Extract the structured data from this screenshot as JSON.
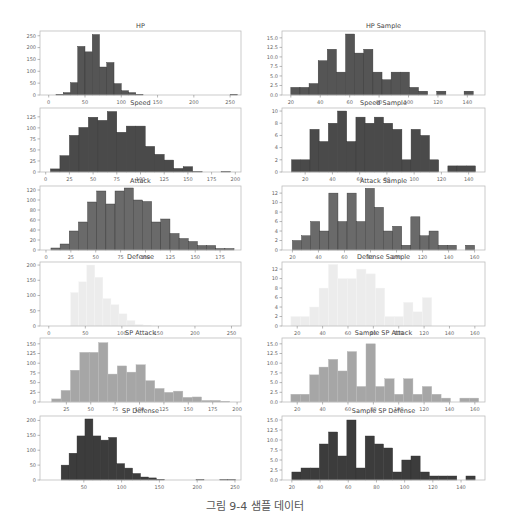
{
  "caption": "그림 9-4 샘플 데이터",
  "colors": {
    "HP": "#555555",
    "Speed": "#4a4a4a",
    "Attack": "#6a6a6a",
    "Defense": "#ececec",
    "SP Attack": "#a6a6a6",
    "SP Defense": "#3c3c3c"
  },
  "chart_data": [
    {
      "type": "bar",
      "title": "HP",
      "col": 0,
      "row": 0,
      "color_key": "HP",
      "bins_start": 0,
      "bin_width": 10,
      "xlim": [
        -12,
        265
      ],
      "ylim": [
        0,
        270
      ],
      "xticks": [
        0,
        50,
        100,
        150,
        200,
        250
      ],
      "yticks": [
        0,
        50,
        100,
        150,
        200,
        250
      ],
      "values": [
        0,
        3,
        10,
        52,
        205,
        182,
        255,
        118,
        137,
        48,
        18,
        10,
        3,
        0,
        0,
        0,
        0,
        0,
        0,
        0,
        0,
        0,
        0,
        0,
        0,
        3
      ]
    },
    {
      "type": "bar",
      "title": "HP Sample",
      "col": 1,
      "row": 0,
      "color_key": "HP",
      "bins_start": 20,
      "bin_width": 6.2,
      "xlim": [
        14,
        152
      ],
      "ylim": [
        0,
        16.8
      ],
      "xticks": [
        20,
        40,
        60,
        80,
        100,
        120,
        140
      ],
      "yticks": [
        0,
        2.5,
        5,
        7.5,
        10,
        12.5,
        15
      ],
      "ytick_labels": [
        "0.0",
        "2.5",
        "5.0",
        "7.5",
        "10.0",
        "12.5",
        "15.0"
      ],
      "values": [
        2,
        2,
        3,
        9,
        12,
        6,
        16,
        11,
        12,
        6,
        4,
        6,
        6,
        2,
        1,
        0,
        1,
        0,
        0,
        1
      ]
    },
    {
      "type": "bar",
      "title": "Speed",
      "col": 0,
      "row": 1,
      "color_key": "Speed",
      "bins_start": 5,
      "bin_width": 10,
      "xlim": [
        -6,
        206
      ],
      "ylim": [
        0,
        145
      ],
      "xticks": [
        0,
        25,
        50,
        75,
        100,
        125,
        150,
        175,
        200
      ],
      "yticks": [
        0,
        25,
        50,
        75,
        100,
        125
      ],
      "values": [
        7,
        37,
        83,
        101,
        124,
        117,
        137,
        90,
        104,
        104,
        58,
        40,
        27,
        8,
        12,
        1,
        0,
        0,
        1,
        0
      ]
    },
    {
      "type": "bar",
      "title": "Speed Sample",
      "col": 1,
      "row": 1,
      "color_key": "Speed",
      "bins_start": 10,
      "bin_width": 6.75,
      "xlim": [
        3,
        152
      ],
      "ylim": [
        0,
        10.5
      ],
      "xticks": [
        20,
        40,
        60,
        80,
        100,
        120,
        140
      ],
      "yticks": [
        0,
        2,
        4,
        6,
        8,
        10
      ],
      "values": [
        2,
        2,
        7,
        5,
        8,
        10,
        5,
        9,
        8,
        9,
        8,
        7,
        2,
        7,
        6,
        2,
        0,
        1,
        1,
        1
      ]
    },
    {
      "type": "bar",
      "title": "Attack",
      "col": 0,
      "row": 2,
      "color_key": "Attack",
      "bins_start": 5,
      "bin_width": 9.2,
      "xlim": [
        -6,
        196
      ],
      "ylim": [
        0,
        128
      ],
      "xticks": [
        0,
        25,
        50,
        75,
        100,
        125,
        150,
        175
      ],
      "yticks": [
        0,
        20,
        40,
        60,
        80,
        100,
        120
      ],
      "values": [
        4,
        12,
        38,
        56,
        96,
        118,
        92,
        118,
        124,
        100,
        97,
        56,
        62,
        33,
        23,
        17,
        9,
        9,
        3,
        3
      ]
    },
    {
      "type": "bar",
      "title": "Attack Sample",
      "col": 1,
      "row": 2,
      "color_key": "Attack",
      "bins_start": 20,
      "bin_width": 7,
      "xlim": [
        12,
        168
      ],
      "ylim": [
        0,
        13.5
      ],
      "xticks": [
        20,
        40,
        60,
        80,
        100,
        120,
        140,
        160
      ],
      "yticks": [
        0,
        2,
        4,
        6,
        8,
        10,
        12
      ],
      "values": [
        2,
        3,
        6,
        4,
        12,
        6,
        12,
        6,
        13,
        9,
        4,
        5,
        1,
        7,
        3,
        4,
        1,
        1,
        0,
        1
      ]
    },
    {
      "type": "bar",
      "title": "Defense",
      "col": 0,
      "row": 3,
      "color_key": "Defense",
      "bins_start": 30,
      "bin_width": 11,
      "xlim": [
        -12,
        263
      ],
      "ylim": [
        0,
        210
      ],
      "xticks": [
        0,
        50,
        100,
        150,
        200,
        250
      ],
      "yticks": [
        0,
        50,
        100,
        150,
        200
      ],
      "values": [
        110,
        145,
        200,
        160,
        90,
        70,
        40,
        18,
        5,
        2,
        0,
        0,
        0,
        0,
        0,
        0,
        0,
        0,
        0,
        0,
        1
      ]
    },
    {
      "type": "bar",
      "title": "Defense Sample",
      "col": 1,
      "row": 3,
      "color_key": "Defense",
      "bins_start": 15,
      "bin_width": 7.4,
      "xlim": [
        8,
        168
      ],
      "ylim": [
        0,
        13.5
      ],
      "xticks": [
        20,
        40,
        60,
        80,
        100,
        120,
        140,
        160
      ],
      "yticks": [
        0,
        2,
        4,
        6,
        8,
        10,
        12
      ],
      "values": [
        2,
        2,
        4,
        8,
        13,
        10,
        10,
        12,
        11,
        8,
        2,
        2,
        5,
        3,
        6,
        0,
        0,
        0,
        0,
        0,
        0
      ]
    },
    {
      "type": "bar",
      "title": "SP Attack",
      "col": 0,
      "row": 4,
      "color_key": "SP Attack",
      "bins_start": 10,
      "bin_width": 9.6,
      "xlim": [
        -2,
        204
      ],
      "ylim": [
        0,
        165
      ],
      "xticks": [
        25,
        50,
        75,
        100,
        125,
        150,
        175,
        200
      ],
      "yticks": [
        0,
        25,
        50,
        75,
        100,
        125,
        150
      ],
      "values": [
        8,
        30,
        82,
        128,
        128,
        153,
        72,
        93,
        77,
        96,
        55,
        35,
        25,
        28,
        12,
        13,
        4,
        4,
        2,
        0
      ]
    },
    {
      "type": "bar",
      "title": "Sample SP Attack",
      "col": 1,
      "row": 4,
      "color_key": "SP Attack",
      "bins_start": 15,
      "bin_width": 7.4,
      "xlim": [
        8,
        168
      ],
      "ylim": [
        0,
        16.5
      ],
      "xticks": [
        20,
        40,
        60,
        80,
        100,
        120,
        140,
        160
      ],
      "yticks": [
        0,
        2.5,
        5,
        7.5,
        10,
        12.5,
        15
      ],
      "ytick_labels": [
        "0.0",
        "2.5",
        "5.0",
        "7.5",
        "10.0",
        "12.5",
        "15.0"
      ],
      "values": [
        2,
        2,
        7,
        9,
        11,
        8,
        13,
        4,
        15,
        4,
        6,
        2,
        6,
        2,
        4,
        2,
        1,
        0,
        1,
        1
      ]
    },
    {
      "type": "bar",
      "title": "SP Defense",
      "col": 0,
      "row": 5,
      "color_key": "SP Defense",
      "bins_start": 20,
      "bin_width": 10.5,
      "xlim": [
        -8,
        258
      ],
      "ylim": [
        0,
        215
      ],
      "xticks": [
        50,
        100,
        150,
        200,
        250
      ],
      "yticks": [
        0,
        50,
        100,
        150,
        200
      ],
      "values": [
        50,
        90,
        148,
        205,
        148,
        134,
        143,
        55,
        40,
        22,
        10,
        7,
        2,
        0,
        0,
        0,
        0,
        1,
        0,
        0,
        1,
        1
      ]
    },
    {
      "type": "bar",
      "title": "Sample SP Defense",
      "col": 1,
      "row": 5,
      "color_key": "SP Defense",
      "bins_start": 20,
      "bin_width": 6.5,
      "xlim": [
        13,
        157
      ],
      "ylim": [
        0,
        16
      ],
      "xticks": [
        20,
        40,
        60,
        80,
        100,
        120,
        140
      ],
      "yticks": [
        0,
        2.5,
        5,
        7.5,
        10,
        12.5,
        15
      ],
      "ytick_labels": [
        "0.0",
        "2.5",
        "5.0",
        "7.5",
        "10.0",
        "12.5",
        "15.0"
      ],
      "values": [
        2,
        3,
        3,
        9,
        12,
        6,
        15,
        3,
        11,
        9,
        8,
        2,
        5,
        6,
        2,
        1,
        1,
        1,
        0,
        1
      ]
    }
  ]
}
